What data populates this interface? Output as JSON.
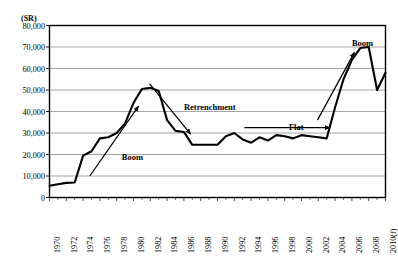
{
  "chart_data": {
    "type": "line",
    "title": "",
    "subtitle": "",
    "unit_label": "(SR)",
    "xlabel": "",
    "ylabel": "",
    "ylim": [
      0,
      80000
    ],
    "xlim": [
      1970,
      2010
    ],
    "grid": true,
    "legend_position": "none",
    "ytick_labels": [
      "80,000",
      "70,000",
      "60,000",
      "50,000",
      "40,000",
      "30,000",
      "20,000",
      "10,000",
      "0"
    ],
    "ytick_values": [
      80000,
      70000,
      60000,
      50000,
      40000,
      30000,
      20000,
      10000,
      0
    ],
    "xtick_labels": [
      "1970",
      "1972",
      "1974",
      "1976",
      "1978",
      "1980",
      "1982",
      "1984",
      "1986",
      "1988",
      "1990",
      "1992",
      "1994",
      "1996",
      "1998",
      "2000",
      "2002",
      "2004",
      "2006",
      "2008",
      "2010(f)"
    ],
    "xtick_values": [
      1970,
      1972,
      1974,
      1976,
      1978,
      1980,
      1982,
      1984,
      1986,
      1988,
      1990,
      1992,
      1994,
      1996,
      1998,
      2000,
      2002,
      2004,
      2006,
      2008,
      2010
    ],
    "series": [
      {
        "name": "Budget",
        "color": "#000000",
        "x": [
          1970,
          1971,
          1972,
          1973,
          1974,
          1975,
          1976,
          1977,
          1978,
          1979,
          1980,
          1981,
          1982,
          1983,
          1984,
          1985,
          1986,
          1987,
          1988,
          1989,
          1990,
          1991,
          1992,
          1993,
          1994,
          1995,
          1996,
          1997,
          1998,
          1999,
          2000,
          2001,
          2002,
          2003,
          2004,
          2005,
          2006,
          2007,
          2008,
          2009,
          2010
        ],
        "values": [
          5500,
          6200,
          6800,
          7000,
          19500,
          21500,
          27500,
          28000,
          30000,
          34500,
          44000,
          50500,
          51000,
          49500,
          36000,
          31000,
          30500,
          24500,
          24500,
          24500,
          24500,
          28500,
          30000,
          27000,
          25500,
          28000,
          26500,
          29000,
          28500,
          27500,
          29000,
          28500,
          28000,
          27500,
          42000,
          55000,
          64000,
          69500,
          70000,
          50000,
          58000
        ]
      }
    ],
    "annotations": [
      {
        "text": "Boom",
        "x": 1978.6,
        "y": 21000
      },
      {
        "text": "Retrenchment",
        "x": 1986.0,
        "y": 44500
      },
      {
        "text": "Flat",
        "x": 1998.5,
        "y": 35000
      },
      {
        "text": "Boom",
        "x": 2006.0,
        "y": 74000
      }
    ],
    "arrows": [
      {
        "name": "boom-arrow-1",
        "x1": 1974.8,
        "y1": 10000,
        "x2": 1980.6,
        "y2": 42500
      },
      {
        "name": "retrenchment-arrow",
        "x1": 1981.9,
        "y1": 53000,
        "x2": 1986.8,
        "y2": 29500
      },
      {
        "name": "flat-arrow",
        "x1": 1993.2,
        "y1": 32500,
        "x2": 2003.4,
        "y2": 32500
      },
      {
        "name": "boom-arrow-2",
        "x1": 2001.9,
        "y1": 36000,
        "x2": 2006.3,
        "y2": 67500
      }
    ]
  }
}
